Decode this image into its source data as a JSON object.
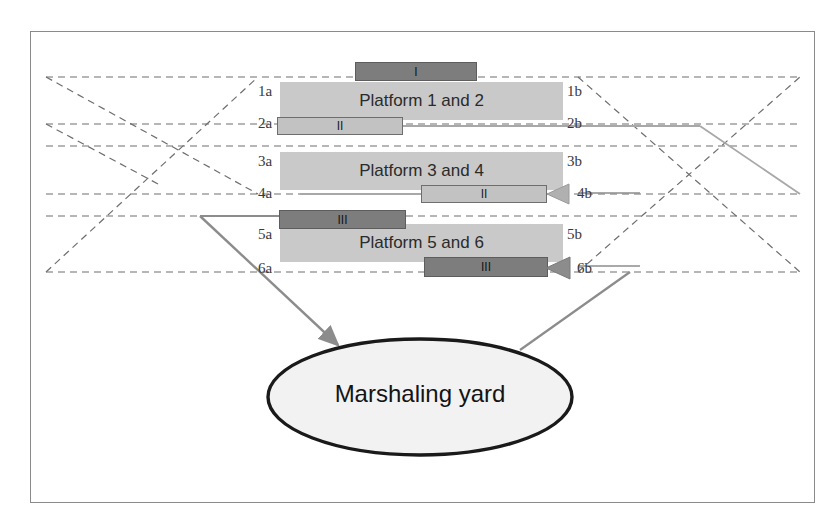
{
  "diagram": {
    "frame": {
      "border_color": "#8a8a8a",
      "background": "#ffffff"
    },
    "colors": {
      "platform_fill": "#c9c9c9",
      "train_dark_fill": "#7d7d7d",
      "train_light_fill": "#c2c2c2",
      "dashed_track": "#6e6e6e",
      "solid_route": "#a8a8a8",
      "arrow": "#8c8c8c",
      "ellipse_stroke": "#1a1a1a",
      "ellipse_fill": "#f2f2f2"
    },
    "platforms": [
      {
        "id": "platform-1-2",
        "label": "Platform 1 and 2"
      },
      {
        "id": "platform-3-4",
        "label": "Platform 3 and 4"
      },
      {
        "id": "platform-5-6",
        "label": "Platform 5 and 6"
      }
    ],
    "track_labels_left": [
      "1a",
      "2a",
      "3a",
      "4a",
      "5a",
      "6a"
    ],
    "track_labels_right": [
      "1b",
      "2b",
      "3b",
      "4b",
      "5b",
      "6b"
    ],
    "trains": [
      {
        "id": "train-I-top",
        "label": "I",
        "track": "1a",
        "style": "dark"
      },
      {
        "id": "train-II-left",
        "label": "II",
        "track": "2a",
        "style": "light"
      },
      {
        "id": "train-II-right",
        "label": "II",
        "track": "4b",
        "style": "light"
      },
      {
        "id": "train-III-left",
        "label": "III",
        "track": "5a",
        "style": "dark"
      },
      {
        "id": "train-III-right",
        "label": "III",
        "track": "6b",
        "style": "dark"
      }
    ],
    "yard": {
      "label": "Marshaling yard"
    }
  }
}
